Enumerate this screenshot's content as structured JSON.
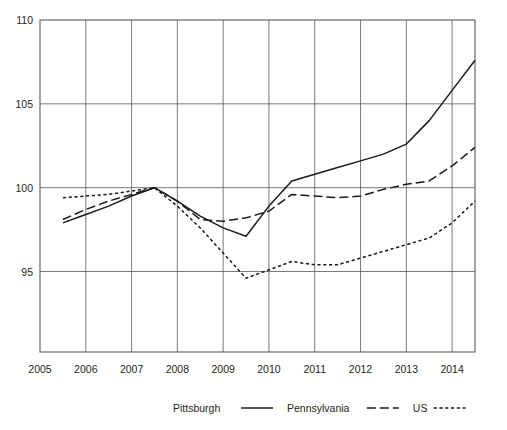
{
  "chart_data": {
    "type": "line",
    "title": "",
    "subtitle": "",
    "xlabel": "",
    "ylabel": "",
    "xlim": [
      2005,
      2014.5
    ],
    "ylim": [
      90.2,
      110
    ],
    "grid": true,
    "legend_position": "bottom",
    "y_ticks": [
      "110",
      "105",
      "100",
      "95"
    ],
    "y_tick_values": [
      110,
      105,
      100,
      95
    ],
    "x_ticks": [
      "2005",
      "2006",
      "2007",
      "2008",
      "2009",
      "2010",
      "2011",
      "2012",
      "2013",
      "2014"
    ],
    "x_tick_values": [
      2005,
      2006,
      2007,
      2008,
      2009,
      2010,
      2011,
      2012,
      2013,
      2014
    ],
    "x": [
      2005.5,
      2006,
      2006.5,
      2007,
      2007.5,
      2008,
      2008.5,
      2009,
      2009.5,
      2010,
      2010.5,
      2011,
      2011.5,
      2012,
      2012.5,
      2013,
      2013.5,
      2014,
      2014.5
    ],
    "series": [
      {
        "name": "Pittsburgh",
        "style": "solid",
        "values": [
          97.9,
          98.4,
          98.9,
          99.5,
          100.0,
          99.2,
          98.3,
          97.6,
          97.1,
          98.9,
          100.4,
          100.8,
          101.2,
          101.6,
          102.0,
          102.6,
          104.0,
          105.8,
          107.6
        ]
      },
      {
        "name": "Pennsylvania",
        "style": "long-dash",
        "values": [
          98.1,
          98.7,
          99.2,
          99.6,
          100.0,
          99.2,
          98.1,
          98.0,
          98.2,
          98.6,
          99.6,
          99.5,
          99.4,
          99.5,
          99.9,
          100.2,
          100.4,
          101.3,
          102.4
        ]
      },
      {
        "name": "US",
        "style": "short-dash",
        "values": [
          99.4,
          99.5,
          99.6,
          99.8,
          100.0,
          98.9,
          97.6,
          96.1,
          94.6,
          95.1,
          95.6,
          95.4,
          95.4,
          95.8,
          96.2,
          96.6,
          97.0,
          97.9,
          99.2
        ]
      }
    ]
  },
  "legend": {
    "entries": [
      {
        "label": "Pittsburgh",
        "style": "solid"
      },
      {
        "label": "Pennsylvania",
        "style": "long-dash"
      },
      {
        "label": "US",
        "style": "short-dash"
      }
    ]
  }
}
